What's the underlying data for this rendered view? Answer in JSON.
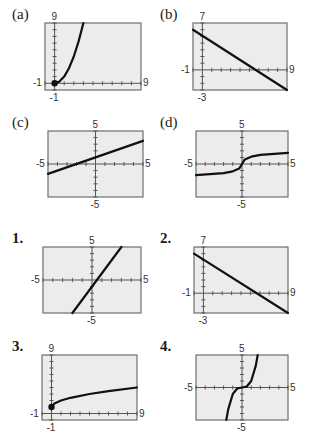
{
  "chart_data": [
    {
      "id": "a",
      "label": "(a)",
      "type": "line",
      "xlim": [
        -1,
        9
      ],
      "ylim": [
        -1,
        9
      ],
      "tick_labels": {
        "ymax": "9",
        "xmin": "-1",
        "xmax": "9",
        "ymin": "-1"
      },
      "curve": "y = x^2 (x >= 0)",
      "series": [
        {
          "name": "curve",
          "x": [
            0,
            0.5,
            1,
            1.5,
            2,
            2.5,
            3
          ],
          "y": [
            0,
            0.25,
            1,
            2.25,
            4,
            6.25,
            9
          ]
        }
      ],
      "endpoint": [
        0,
        0
      ]
    },
    {
      "id": "b",
      "label": "(b)",
      "type": "line",
      "xlim": [
        -1,
        9
      ],
      "ylim": [
        -3,
        7
      ],
      "tick_labels": {
        "ymax": "7",
        "xmin": "-1",
        "xmax": "9",
        "ymin": "-3"
      },
      "curve": "y = 5 - x",
      "series": [
        {
          "name": "line",
          "x": [
            -1,
            9
          ],
          "y": [
            6,
            -4
          ]
        }
      ]
    },
    {
      "id": "c",
      "label": "(c)",
      "type": "line",
      "xlim": [
        -5,
        5
      ],
      "ylim": [
        -5,
        5
      ],
      "tick_labels": {
        "ymax": "5",
        "xmin": "-5",
        "xmax": "5",
        "ymin": "-5"
      },
      "curve": "y = x/2 + 1",
      "series": [
        {
          "name": "line",
          "x": [
            -5,
            5
          ],
          "y": [
            -1.5,
            3.5
          ]
        }
      ]
    },
    {
      "id": "d",
      "label": "(d)",
      "type": "line",
      "xlim": [
        -5,
        5
      ],
      "ylim": [
        -5,
        5
      ],
      "tick_labels": {
        "ymax": "5",
        "xmin": "-5",
        "xmax": "5",
        "ymin": "-5"
      },
      "curve": "y = cube-root-like",
      "series": [
        {
          "name": "curve",
          "x": [
            -5,
            -2,
            -1,
            -0.3,
            0,
            0.3,
            1,
            2,
            5
          ],
          "y": [
            -1.7,
            -1.4,
            -1.1,
            -0.7,
            0,
            0.7,
            1.1,
            1.4,
            1.7
          ]
        }
      ]
    },
    {
      "id": "1",
      "label": "1.",
      "type": "line",
      "xlim": [
        -5,
        5
      ],
      "ylim": [
        -5,
        5
      ],
      "tick_labels": {
        "ymax": "5",
        "xmin": "-5",
        "xmax": "5",
        "ymin": "-5"
      },
      "curve": "y = 2x - 1",
      "series": [
        {
          "name": "line",
          "x": [
            -2,
            3
          ],
          "y": [
            -5,
            5
          ]
        }
      ]
    },
    {
      "id": "2",
      "label": "2.",
      "type": "line",
      "xlim": [
        -1,
        9
      ],
      "ylim": [
        -3,
        7
      ],
      "tick_labels": {
        "ymax": "7",
        "xmin": "-1",
        "xmax": "9",
        "ymin": "-3"
      },
      "curve": "y = 5 - x",
      "series": [
        {
          "name": "line",
          "x": [
            -1,
            9
          ],
          "y": [
            6,
            -4
          ]
        }
      ]
    },
    {
      "id": "3",
      "label": "3.",
      "type": "line",
      "xlim": [
        -1,
        9
      ],
      "ylim": [
        -1,
        9
      ],
      "tick_labels": {
        "ymax": "9",
        "xmin": "-1",
        "xmax": "9",
        "ymin": "-1"
      },
      "curve": "y = sqrt(x) + 1",
      "series": [
        {
          "name": "curve",
          "x": [
            0,
            0.25,
            1,
            2,
            4,
            6,
            9
          ],
          "y": [
            1,
            1.5,
            2,
            2.41,
            3,
            3.45,
            4
          ]
        }
      ],
      "endpoint": [
        0,
        1
      ]
    },
    {
      "id": "4",
      "label": "4.",
      "type": "line",
      "xlim": [
        -5,
        5
      ],
      "ylim": [
        -5,
        5
      ],
      "tick_labels": {
        "ymax": "5",
        "xmin": "-5",
        "xmax": "5",
        "ymin": "-5"
      },
      "curve": "y = x^3",
      "series": [
        {
          "name": "curve",
          "x": [
            -1.71,
            -1.5,
            -1,
            -0.5,
            0,
            0.5,
            1,
            1.5,
            1.71
          ],
          "y": [
            -5,
            -3.375,
            -1,
            -0.125,
            0,
            0.125,
            1,
            3.375,
            5
          ]
        }
      ]
    }
  ]
}
